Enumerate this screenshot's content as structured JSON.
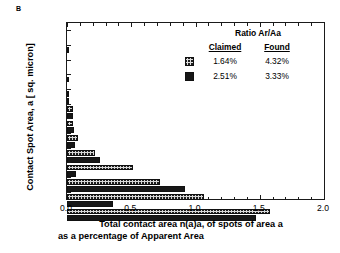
{
  "panel": {
    "label": "B"
  },
  "axes": {
    "y_title": "Contact Spot Area, a [ sq. micron]",
    "x_title_line1": "Total contact area n(a)a, of spots of area a",
    "x_title_line2": "as a percentage of Apparent Area",
    "x_ticklabels": [
      "0.0",
      "0.5",
      "1.0",
      "1.5",
      "2.0"
    ],
    "y_ticklabels": [
      "0.04",
      "0.063",
      "0.13",
      "0.292",
      "0.624",
      "1.35",
      "2.92",
      "6.45",
      "14.14",
      "30.91",
      "67.73",
      "100"
    ]
  },
  "legend": {
    "title": "Ratio Ar/Aa",
    "col1_header": "Claimed",
    "col2_header": "Found",
    "rows": [
      {
        "swatch": "claimed",
        "claimed": "1.64%",
        "found": "4.32%"
      },
      {
        "swatch": "found",
        "claimed": "2.51%",
        "found": "3.33%"
      }
    ]
  },
  "colors": {
    "claimed_fill": "#d8d8d8",
    "found_fill": "#171717",
    "axis": "#1a1a1a"
  },
  "chart_data": {
    "type": "bar",
    "orientation": "horizontal",
    "title": "",
    "xlabel": "Total contact area n(a)a, of spots of area a as a percentage of Apparent Area",
    "ylabel": "Contact Spot Area, a [ sq. micron]",
    "xlim": [
      0.0,
      2.0
    ],
    "xticks": [
      0.0,
      0.5,
      1.0,
      1.5,
      2.0
    ],
    "grid": false,
    "legend_position": "upper right",
    "categories": [
      "0.04",
      "0.063",
      "0.13",
      "0.292",
      "0.624",
      "1.35",
      "2.92",
      "6.45",
      "14.14",
      "30.91",
      "67.73",
      "100"
    ],
    "series": [
      {
        "name": "Claimed 1.64% / Found 4.32%",
        "style": "hatched",
        "values": [
          0.005,
          0.0,
          0.008,
          0.012,
          0.045,
          0.05,
          0.085,
          0.22,
          0.51,
          0.72,
          1.07,
          1.58
        ]
      },
      {
        "name": "Claimed 2.51% / Found 3.33%",
        "style": "solid-black",
        "values": [
          0.0,
          0.0,
          0.0,
          0.015,
          0.05,
          0.055,
          0.065,
          0.26,
          0.07,
          0.92,
          0.36,
          1.47
        ]
      }
    ]
  }
}
